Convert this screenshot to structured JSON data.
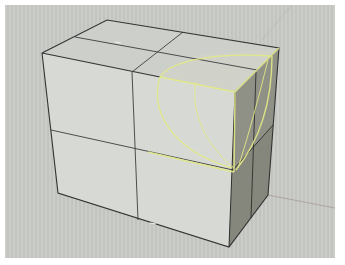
{
  "viewport": {
    "name": "Perspective",
    "background": "#c8cac6",
    "frame_color": "#ffffff"
  },
  "scene": {
    "object": "box",
    "subdivisions": {
      "u": 2,
      "v": 2,
      "w": 2
    },
    "edge_color": "#3a3a3a",
    "face_colors": {
      "front": "#d6d8d4",
      "top": "#cfd1cd",
      "right": "#8e8f84",
      "right_dark": "#7d7e72"
    },
    "selection": {
      "label": "selected sub-box",
      "highlight_color": "#e8ee8a"
    },
    "construction_axes_color": "#a8a09a"
  }
}
